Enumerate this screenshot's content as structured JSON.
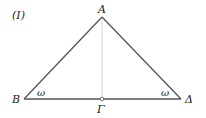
{
  "figure": {
    "tag": "(I)",
    "points": {
      "A": "A",
      "B": "B",
      "Gamma": "Γ",
      "Delta": "Δ"
    },
    "angles": {
      "left": "ω",
      "right": "ω"
    },
    "colors": {
      "line": "#555555",
      "altitude": "#cccccc",
      "text": "#222222"
    }
  }
}
